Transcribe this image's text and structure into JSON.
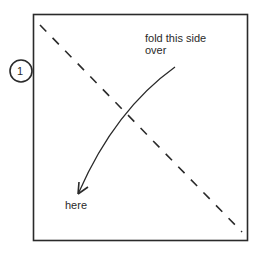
{
  "diagram": {
    "step_number": "1",
    "instruction_line1": "fold this side",
    "instruction_line2": "over",
    "target_label": "here",
    "colors": {
      "stroke": "#2a2a2a",
      "background": "#ffffff"
    }
  }
}
